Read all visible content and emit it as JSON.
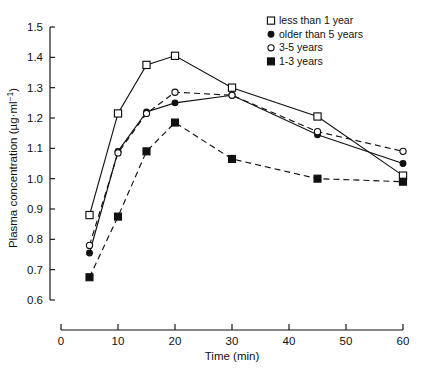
{
  "chart_data": {
    "type": "line",
    "title": "",
    "xlabel": "Time (min)",
    "ylabel": "Plasma concentration (µg·ml⁻¹)",
    "xlim": [
      0,
      60
    ],
    "ylim": [
      0.6,
      1.5
    ],
    "xticks": [
      0,
      10,
      20,
      30,
      40,
      50,
      60
    ],
    "yticks": [
      0.6,
      0.7,
      0.8,
      0.9,
      1.0,
      1.1,
      1.2,
      1.3,
      1.4,
      1.5
    ],
    "xtick_labels": [
      "0",
      "10",
      "20",
      "30",
      "40",
      "50",
      "60"
    ],
    "ytick_labels": [
      "0.6",
      "0.7",
      "0.8",
      "0.9",
      "1.0",
      "1.1",
      "1.2",
      "1.3",
      "1.4",
      "1.5"
    ],
    "grid": false,
    "legend_position": "top-right",
    "x": [
      5,
      10,
      15,
      20,
      30,
      45,
      60
    ],
    "series": [
      {
        "name": "less than 1 year",
        "marker": "open-square",
        "linestyle": "solid",
        "values": [
          0.88,
          1.215,
          1.375,
          1.405,
          1.3,
          1.205,
          1.01
        ]
      },
      {
        "name": "older than 5 years",
        "marker": "filled-circle",
        "linestyle": "solid",
        "values": [
          0.755,
          1.09,
          1.22,
          1.25,
          1.275,
          1.145,
          1.05
        ]
      },
      {
        "name": "3-5 years",
        "marker": "open-circle",
        "linestyle": "dashed",
        "values": [
          0.78,
          1.085,
          1.215,
          1.285,
          1.275,
          1.155,
          1.09
        ]
      },
      {
        "name": "1-3 years",
        "marker": "filled-square",
        "linestyle": "dashed",
        "values": [
          0.675,
          0.875,
          1.09,
          1.185,
          1.065,
          1.0,
          0.99
        ]
      }
    ]
  },
  "legend": {
    "items": [
      {
        "label": "less than 1 year",
        "marker": "open-square"
      },
      {
        "label": "older than 5 years",
        "marker": "filled-circle"
      },
      {
        "label": "3-5 years",
        "marker": "open-circle"
      },
      {
        "label": "1-3 years",
        "marker": "filled-square"
      }
    ]
  },
  "axes": {
    "x_title": "Time (min)",
    "y_title_main": "Plasma concentration (",
    "y_title_unit": "µg·ml",
    "y_title_exp": "−1",
    "y_title_close": ")"
  }
}
